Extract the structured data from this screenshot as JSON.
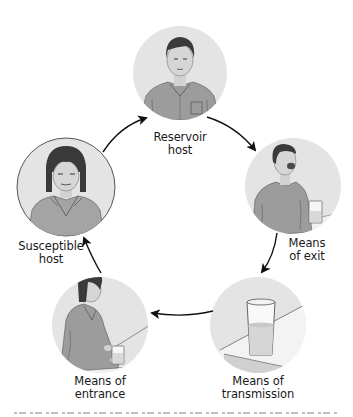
{
  "diagram": {
    "type": "cycle",
    "colors": {
      "background": "#ffffff",
      "circle_fill": "#e4e4e4",
      "circle_outline": "#555555",
      "shirt": "#9c9c9c",
      "shirt_dark": "#6e6e6e",
      "hair": "#3a3a3a",
      "skin": "#d2d2d2",
      "arrow": "#111111",
      "label_text": "#1a1a1a"
    },
    "nodes": [
      {
        "id": "reservoir",
        "label_line1": "Reservoir",
        "label_line2": "host",
        "illustration": "man-portrait-shirt-pocket",
        "order": 1
      },
      {
        "id": "exit",
        "label_line1": "Means",
        "label_line2": "of exit",
        "illustration": "man-coughing-glass-on-table",
        "order": 2
      },
      {
        "id": "transmission",
        "label_line1": "Means of",
        "label_line2": "transmission",
        "illustration": "glass-of-water-on-table",
        "order": 3
      },
      {
        "id": "entrance",
        "label_line1": "Means of",
        "label_line2": "entrance",
        "illustration": "woman-holding-glass",
        "order": 4
      },
      {
        "id": "susceptible",
        "label_line1": "Susceptible",
        "label_line2": "host",
        "illustration": "woman-portrait",
        "order": 5
      }
    ],
    "edges": [
      {
        "from": "susceptible",
        "to": "reservoir"
      },
      {
        "from": "reservoir",
        "to": "exit"
      },
      {
        "from": "exit",
        "to": "transmission"
      },
      {
        "from": "transmission",
        "to": "entrance"
      },
      {
        "from": "entrance",
        "to": "susceptible"
      }
    ]
  }
}
